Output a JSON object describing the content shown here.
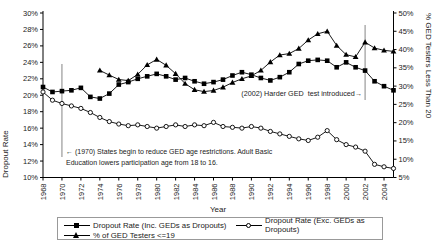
{
  "chart_data": {
    "type": "line",
    "title": "",
    "x": {
      "label": "Year",
      "min": 1968,
      "max": 2005,
      "tick_min": 1968,
      "tick_max": 2004,
      "tick_step": 2
    },
    "left_axis": {
      "title": "Dropout Rate",
      "min": 10,
      "max": 30,
      "tick_step": 2,
      "suffix": "%"
    },
    "right_axis": {
      "title": "% GED Testers Less Than 20",
      "min": 5,
      "max": 50,
      "tick_step": 5,
      "suffix": "%"
    },
    "years": [
      1968,
      1969,
      1970,
      1971,
      1972,
      1973,
      1974,
      1975,
      1976,
      1977,
      1978,
      1979,
      1980,
      1981,
      1982,
      1983,
      1984,
      1985,
      1986,
      1987,
      1988,
      1989,
      1990,
      1991,
      1992,
      1993,
      1994,
      1995,
      1996,
      1997,
      1998,
      1999,
      2000,
      2001,
      2002,
      2003,
      2004,
      2005
    ],
    "series": [
      {
        "name": "Dropout Rate (Inc. GEDs as Dropouts)",
        "marker": "square",
        "axis": "left",
        "values": [
          21.0,
          20.4,
          20.5,
          20.6,
          20.9,
          19.8,
          19.6,
          20.2,
          21.3,
          21.6,
          22.0,
          22.3,
          22.6,
          22.3,
          21.9,
          22.1,
          21.7,
          21.4,
          21.6,
          21.9,
          22.4,
          22.8,
          22.5,
          22.1,
          21.8,
          22.2,
          22.8,
          23.8,
          24.2,
          24.3,
          24.2,
          23.4,
          24.0,
          23.4,
          23.0,
          21.7,
          21.1,
          20.6
        ]
      },
      {
        "name": "Dropout Rate (Exc. GEDs as Dropouts)",
        "marker": "circle",
        "axis": "left",
        "values": [
          20.4,
          19.4,
          19.0,
          18.7,
          18.4,
          17.9,
          17.3,
          16.8,
          16.5,
          16.3,
          16.4,
          16.2,
          16.0,
          16.2,
          16.4,
          16.2,
          16.4,
          16.3,
          16.7,
          16.2,
          16.1,
          16.0,
          16.2,
          16.0,
          15.6,
          15.3,
          15.0,
          14.7,
          14.5,
          14.9,
          15.7,
          14.6,
          14.0,
          13.7,
          13.2,
          11.6,
          11.3,
          11.1
        ]
      },
      {
        "name": "% of GED Testers <=19",
        "marker": "triangle",
        "axis": "right",
        "values": [
          null,
          null,
          null,
          null,
          null,
          null,
          34.3,
          33.0,
          31.8,
          31.5,
          33.2,
          35.8,
          37.3,
          35.7,
          33.4,
          30.7,
          29.0,
          28.5,
          28.8,
          29.7,
          31.0,
          32.0,
          32.8,
          34.3,
          36.6,
          38.5,
          38.9,
          40.3,
          42.6,
          44.3,
          45.0,
          41.1,
          38.6,
          38.0,
          42.0,
          40.4,
          39.8,
          39.5
        ]
      }
    ],
    "annotations": [
      {
        "id": "ged-1970",
        "text": "← (1970) States begin to reduce GED age restrictions. Adult Basic Education lowers participation age from 18 to 16.",
        "line_year": 1970,
        "line_top_px": 64,
        "line_bottom_px": 157
      },
      {
        "id": "ged-2002",
        "text": "(2002) Harder GED  test introduced→",
        "line_year": 2002,
        "line_top_px": 25,
        "line_bottom_px": 100
      }
    ],
    "layout_hints": {
      "grid": "off",
      "legend_position": "bottom-box"
    },
    "colors": {
      "line": "#000000",
      "marker_fill": "#000000",
      "circle_fill": "#ffffff",
      "guide": "#666666",
      "text": "#222222"
    }
  }
}
